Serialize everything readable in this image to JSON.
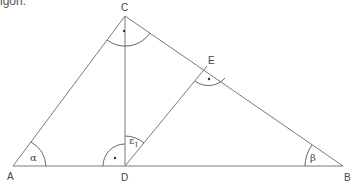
{
  "caption_fragment": "igon.",
  "diagram": {
    "type": "triangle",
    "vertices": {
      "A": {
        "label": "A",
        "x": 13,
        "y": 166
      },
      "B": {
        "label": "B",
        "x": 343,
        "y": 166
      },
      "C": {
        "label": "C",
        "x": 125,
        "y": 16
      },
      "D": {
        "label": "D",
        "x": 125,
        "y": 166
      },
      "E": {
        "label": "E",
        "x": 207,
        "y": 66
      }
    },
    "segments": [
      "AB",
      "AC",
      "CB",
      "CD",
      "DE"
    ],
    "angles": {
      "alpha": {
        "label": "α",
        "at": "A"
      },
      "beta": {
        "label": "β",
        "at": "B"
      },
      "epsilon1": {
        "label": "ε",
        "subscript": "1",
        "at": "D"
      },
      "right_C": {
        "label": "•",
        "at": "C",
        "right_angle": true
      },
      "right_D": {
        "label": "•",
        "at": "D",
        "right_angle": true
      },
      "right_E": {
        "label": "•",
        "at": "E",
        "right_angle": true
      }
    }
  }
}
